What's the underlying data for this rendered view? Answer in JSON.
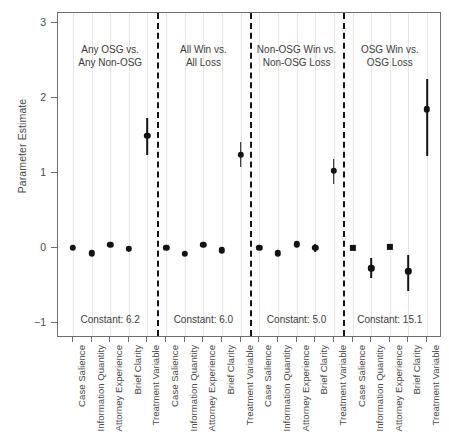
{
  "chart_data": {
    "type": "scatter",
    "title": "",
    "subtitle": "",
    "xlabel": "",
    "ylabel": "Parameter Estimate",
    "ylim": [
      -1.35,
      3.25
    ],
    "yticks": [
      3,
      2,
      1,
      0,
      -1
    ],
    "ytick_labels": [
      "3",
      "2",
      "1",
      "0",
      "−1"
    ],
    "grid": "vertical-light",
    "legend": "none",
    "marker_color": "#131313",
    "grid_color": "#e6e6e6",
    "frame_color": "#6e6e6e",
    "divider_style": "dashed",
    "categories": [
      "Case Salience",
      "Information Quantity",
      "Attorney Experience",
      "Brief Clarity",
      "Treatment Variable"
    ],
    "panels": [
      {
        "title": "Any OSG vs.\nAny Non-OSG",
        "constant_label": "Constant: 6.2",
        "points": [
          {
            "category": "Case Salience",
            "estimate": 0.0,
            "lower": 0.0,
            "upper": 0.0,
            "marker": "circle"
          },
          {
            "category": "Information Quantity",
            "estimate": -0.07,
            "lower": -0.07,
            "upper": -0.07,
            "marker": "circle"
          },
          {
            "category": "Attorney Experience",
            "estimate": 0.04,
            "lower": 0.04,
            "upper": 0.04,
            "marker": "circle"
          },
          {
            "category": "Brief Clarity",
            "estimate": -0.01,
            "lower": -0.05,
            "upper": 0.03,
            "marker": "circle"
          },
          {
            "category": "Treatment Variable",
            "estimate": 1.5,
            "lower": 1.24,
            "upper": 1.74,
            "marker": "circle"
          }
        ]
      },
      {
        "title": "All Win vs.\nAll Loss",
        "constant_label": "Constant: 6.0",
        "points": [
          {
            "category": "Case Salience",
            "estimate": 0.0,
            "lower": 0.0,
            "upper": 0.0,
            "marker": "circle"
          },
          {
            "category": "Information Quantity",
            "estimate": -0.08,
            "lower": -0.08,
            "upper": -0.08,
            "marker": "circle"
          },
          {
            "category": "Attorney Experience",
            "estimate": 0.04,
            "lower": 0.04,
            "upper": 0.04,
            "marker": "circle"
          },
          {
            "category": "Brief Clarity",
            "estimate": -0.03,
            "lower": -0.07,
            "upper": 0.02,
            "marker": "circle"
          },
          {
            "category": "Treatment Variable",
            "estimate": 1.24,
            "lower": 1.08,
            "upper": 1.42,
            "marker": "circle"
          }
        ]
      },
      {
        "title": "Non-OSG Win vs.\nNon-OSG Loss",
        "constant_label": "Constant: 5.0",
        "points": [
          {
            "category": "Case Salience",
            "estimate": 0.0,
            "lower": 0.0,
            "upper": 0.0,
            "marker": "circle"
          },
          {
            "category": "Information Quantity",
            "estimate": -0.07,
            "lower": -0.07,
            "upper": -0.07,
            "marker": "circle"
          },
          {
            "category": "Attorney Experience",
            "estimate": 0.05,
            "lower": 0.05,
            "upper": 0.05,
            "marker": "circle"
          },
          {
            "category": "Brief Clarity",
            "estimate": 0.0,
            "lower": -0.05,
            "upper": 0.05,
            "marker": "circle"
          },
          {
            "category": "Treatment Variable",
            "estimate": 1.03,
            "lower": 0.85,
            "upper": 1.19,
            "marker": "circle"
          }
        ]
      },
      {
        "title": "OSG Win vs.\nOSG Loss",
        "constant_label": "Constant: 15.1",
        "points": [
          {
            "category": "Case Salience",
            "estimate": 0.0,
            "lower": 0.0,
            "upper": 0.0,
            "marker": "square"
          },
          {
            "category": "Information Quantity",
            "estimate": -0.27,
            "lower": -0.4,
            "upper": -0.13,
            "marker": "circle"
          },
          {
            "category": "Attorney Experience",
            "estimate": 0.01,
            "lower": 0.01,
            "upper": 0.01,
            "marker": "square"
          },
          {
            "category": "Brief Clarity",
            "estimate": -0.31,
            "lower": -0.57,
            "upper": -0.09,
            "marker": "circle"
          },
          {
            "category": "Treatment Variable",
            "estimate": 1.85,
            "lower": 1.23,
            "upper": 2.25,
            "marker": "circle"
          }
        ]
      }
    ]
  }
}
